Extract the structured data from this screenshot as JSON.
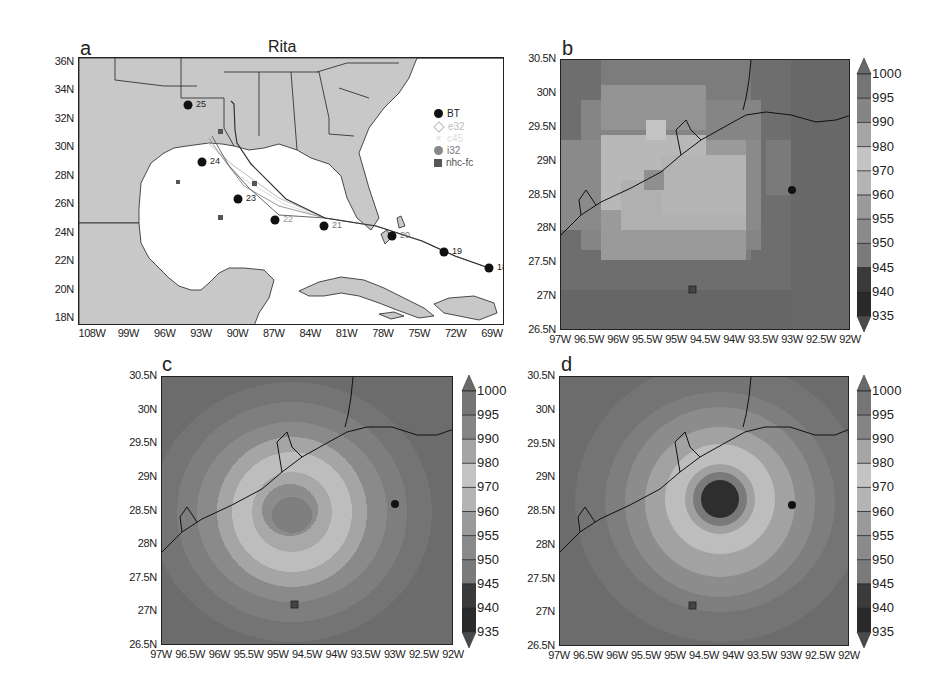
{
  "figure": {
    "panels": [
      {
        "id": "a",
        "label": "a",
        "title": "Rita"
      },
      {
        "id": "b",
        "label": "b"
      },
      {
        "id": "c",
        "label": "c"
      },
      {
        "id": "d",
        "label": "d"
      }
    ]
  },
  "panel_a": {
    "label": "a",
    "title": "Rita",
    "yticks": [
      "36N",
      "34N",
      "32N",
      "30N",
      "28N",
      "26N",
      "24N",
      "22N",
      "20N",
      "18N"
    ],
    "xticks": [
      "108W",
      "99W",
      "96W",
      "93W",
      "90W",
      "87W",
      "84W",
      "81W",
      "78W",
      "75W",
      "72W",
      "69W"
    ],
    "legend": [
      {
        "name": "BT",
        "marker": "filled-circle",
        "color": "#111111"
      },
      {
        "name": "e32",
        "marker": "diamond",
        "color": "#c8c8c8"
      },
      {
        "name": "c45",
        "marker": "cross",
        "color": "#dddddd"
      },
      {
        "name": "i32",
        "marker": "filled-circle",
        "color": "#888888"
      },
      {
        "name": "nhc-fc",
        "marker": "filled-square",
        "color": "#555555"
      }
    ],
    "bt_labels": [
      "25",
      "24",
      "23",
      "22",
      "21",
      "20",
      "19",
      "18"
    ]
  },
  "panel_b": {
    "label": "b",
    "yticks": [
      "30.5N",
      "30N",
      "29.5N",
      "29N",
      "28.5N",
      "28N",
      "27.5N",
      "27N",
      "26.5N"
    ],
    "xticks": [
      "97W",
      "96.5W",
      "96W",
      "95.5W",
      "95W",
      "94.5W",
      "94W",
      "93.5W",
      "93W",
      "92.5W",
      "92W"
    ]
  },
  "panel_c": {
    "label": "c",
    "yticks": [
      "30.5N",
      "30N",
      "29.5N",
      "29N",
      "28.5N",
      "28N",
      "27.5N",
      "27N",
      "26.5N"
    ],
    "xticks": [
      "97W",
      "96.5W",
      "96W",
      "95.5W",
      "95W",
      "94.5W",
      "94W",
      "93.5W",
      "93W",
      "92.5W",
      "92W"
    ]
  },
  "panel_d": {
    "label": "d",
    "yticks": [
      "30.5N",
      "30N",
      "29.5N",
      "29N",
      "28.5N",
      "28N",
      "27.5N",
      "27N",
      "26.5N"
    ],
    "xticks": [
      "97W",
      "96.5W",
      "96W",
      "95.5W",
      "95W",
      "94.5W",
      "94W",
      "93.5W",
      "93W",
      "92.5W",
      "92W"
    ]
  },
  "colorbar": {
    "labels": [
      "1000",
      "995",
      "990",
      "980",
      "970",
      "960",
      "955",
      "950",
      "945",
      "940",
      "935"
    ],
    "colors": [
      "#6a6a6a",
      "#757575",
      "#858585",
      "#a5a5a5",
      "#c4c4c4",
      "#b4b4b4",
      "#9a9a9a",
      "#8a8a8a",
      "#7a7a7a",
      "#3a3a3a",
      "#2a2a2a",
      "#4a4a4a"
    ]
  },
  "chart_data": [
    {
      "type": "scatter",
      "title": "Rita",
      "panel": "a",
      "xlabel": "Longitude",
      "ylabel": "Latitude",
      "xticks": [
        "108W",
        "99W",
        "96W",
        "93W",
        "90W",
        "87W",
        "84W",
        "81W",
        "78W",
        "75W",
        "72W",
        "69W"
      ],
      "yticks": [
        "36N",
        "34N",
        "32N",
        "30N",
        "28N",
        "26N",
        "24N",
        "22N",
        "20N",
        "18N"
      ],
      "legend": [
        "BT",
        "e32",
        "c45",
        "i32",
        "nhc-fc"
      ],
      "series": [
        {
          "name": "BT",
          "labels": [
            "18",
            "19",
            "20",
            "21",
            "22",
            "23",
            "24",
            "25"
          ],
          "lon": [
            -69.7,
            -72.5,
            -76.3,
            -82.3,
            -86.3,
            -89.6,
            -93.0,
            -93.6
          ],
          "lat": [
            21.3,
            22.4,
            23.3,
            24.1,
            24.4,
            26.0,
            28.6,
            32.8
          ]
        },
        {
          "name": "nhc-fc",
          "lon": [
            -86.3,
            -89.0,
            -92.0,
            -93.8,
            -94.5
          ],
          "lat": [
            24.4,
            25.1,
            26.9,
            28.4,
            30.5
          ]
        }
      ],
      "legend_position": "upper right"
    },
    {
      "type": "heatmap",
      "panel": "b",
      "title": "",
      "xlabel": "",
      "ylabel": "",
      "xrange": [
        "97W",
        "92W"
      ],
      "yrange": [
        "26.5N",
        "30.5N"
      ],
      "colorbar_levels": [
        935,
        940,
        945,
        950,
        955,
        960,
        970,
        980,
        990,
        995,
        1000
      ],
      "min_pressure_approx": 970,
      "markers": {
        "observed_center": {
          "lon": -93.0,
          "lat": 28.6
        },
        "nhc_fc": {
          "lon": -94.6,
          "lat": 27.1
        }
      }
    },
    {
      "type": "heatmap",
      "panel": "c",
      "xrange": [
        "97W",
        "92W"
      ],
      "yrange": [
        "26.5N",
        "30.5N"
      ],
      "colorbar_levels": [
        935,
        940,
        945,
        950,
        955,
        960,
        970,
        980,
        990,
        995,
        1000
      ],
      "min_pressure_approx": 950,
      "center": {
        "lon": -94.6,
        "lat": 28.5
      },
      "markers": {
        "observed_center": {
          "lon": -93.0,
          "lat": 28.6
        },
        "nhc_fc": {
          "lon": -94.6,
          "lat": 27.1
        }
      }
    },
    {
      "type": "heatmap",
      "panel": "d",
      "xrange": [
        "97W",
        "92W"
      ],
      "yrange": [
        "26.5N",
        "30.5N"
      ],
      "colorbar_levels": [
        935,
        940,
        945,
        950,
        955,
        960,
        970,
        980,
        990,
        995,
        1000
      ],
      "min_pressure_approx": 940,
      "center": {
        "lon": -94.2,
        "lat": 28.6
      },
      "markers": {
        "observed_center": {
          "lon": -93.0,
          "lat": 28.6
        },
        "nhc_fc": {
          "lon": -94.6,
          "lat": 27.1
        }
      }
    }
  ]
}
